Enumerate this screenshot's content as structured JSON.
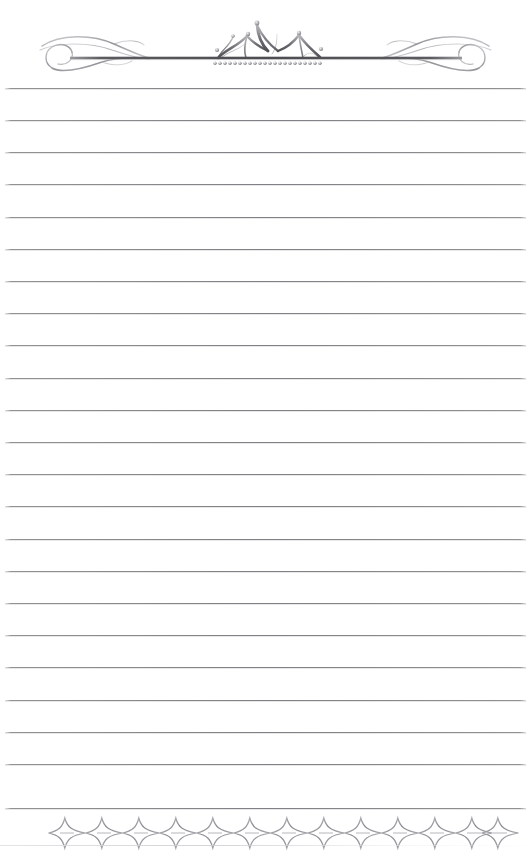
{
  "page": {
    "width": 531,
    "height": 864,
    "background_color": "#ffffff",
    "kind": "blank ruled writing paper with ornamental header and footer"
  },
  "colors": {
    "paper": "#ffffff",
    "rule_line": "#808084",
    "rule_line_light": "#bebec1",
    "ornament_dark": "#4a4a4e",
    "ornament_mid": "#8d8d92",
    "ornament_light": "#c9c9cd",
    "footer_wash": "#e1e1e4"
  },
  "header": {
    "name": "crown-and-flourish-header",
    "bar": {
      "x1": 70,
      "x2": 462,
      "y": 58,
      "thickness": 2.6,
      "color": "#55555a"
    },
    "crown": {
      "name": "crown-ornament",
      "center_x": 266,
      "baseline_y": 58,
      "points": 4,
      "point_heights": [
        22,
        31,
        35,
        26
      ],
      "pearl_tips": 5,
      "pearl_row_count": 22,
      "pearl_row_y": 63,
      "pearl_radius": 1.7,
      "span_x1": 213,
      "span_x2": 325
    },
    "flourish_left": {
      "name": "flourish-left",
      "x1": 38,
      "x2": 148,
      "center_y": 57,
      "style": "s-curve ribbon scroll with closed loop"
    },
    "flourish_right": {
      "name": "flourish-right",
      "x1": 384,
      "x2": 494,
      "center_y": 57,
      "style": "mirrored s-curve ribbon scroll with closed loop"
    }
  },
  "ruled_lines": {
    "name": "writing-lines",
    "count": 23,
    "first_y": 88,
    "spacing": 32.2,
    "x_start": 5,
    "x_end": 526,
    "color": "#808084",
    "thickness": 1,
    "y_positions": [
      88,
      120,
      152,
      184,
      217,
      249,
      281,
      313,
      345,
      378,
      410,
      442,
      474,
      506,
      539,
      571,
      603,
      635,
      667,
      700,
      732,
      764,
      808
    ]
  },
  "footer": {
    "name": "star-diamond-border",
    "description": "Repeating band of concave-sided four-pointed stars with small horizontal dash accents at each junction",
    "star_count": 13,
    "star_width": 37,
    "star_height": 30,
    "band_x1": 48,
    "band_x2": 501,
    "band_center_y": 829,
    "dash_accents": 13,
    "baseline_y": 845,
    "color": "#8d8d92"
  },
  "accessibility": {
    "header_label": "Decorative crown header ornament",
    "lines_label": "Blank ruled writing lines",
    "footer_label": "Decorative star border ornament"
  }
}
